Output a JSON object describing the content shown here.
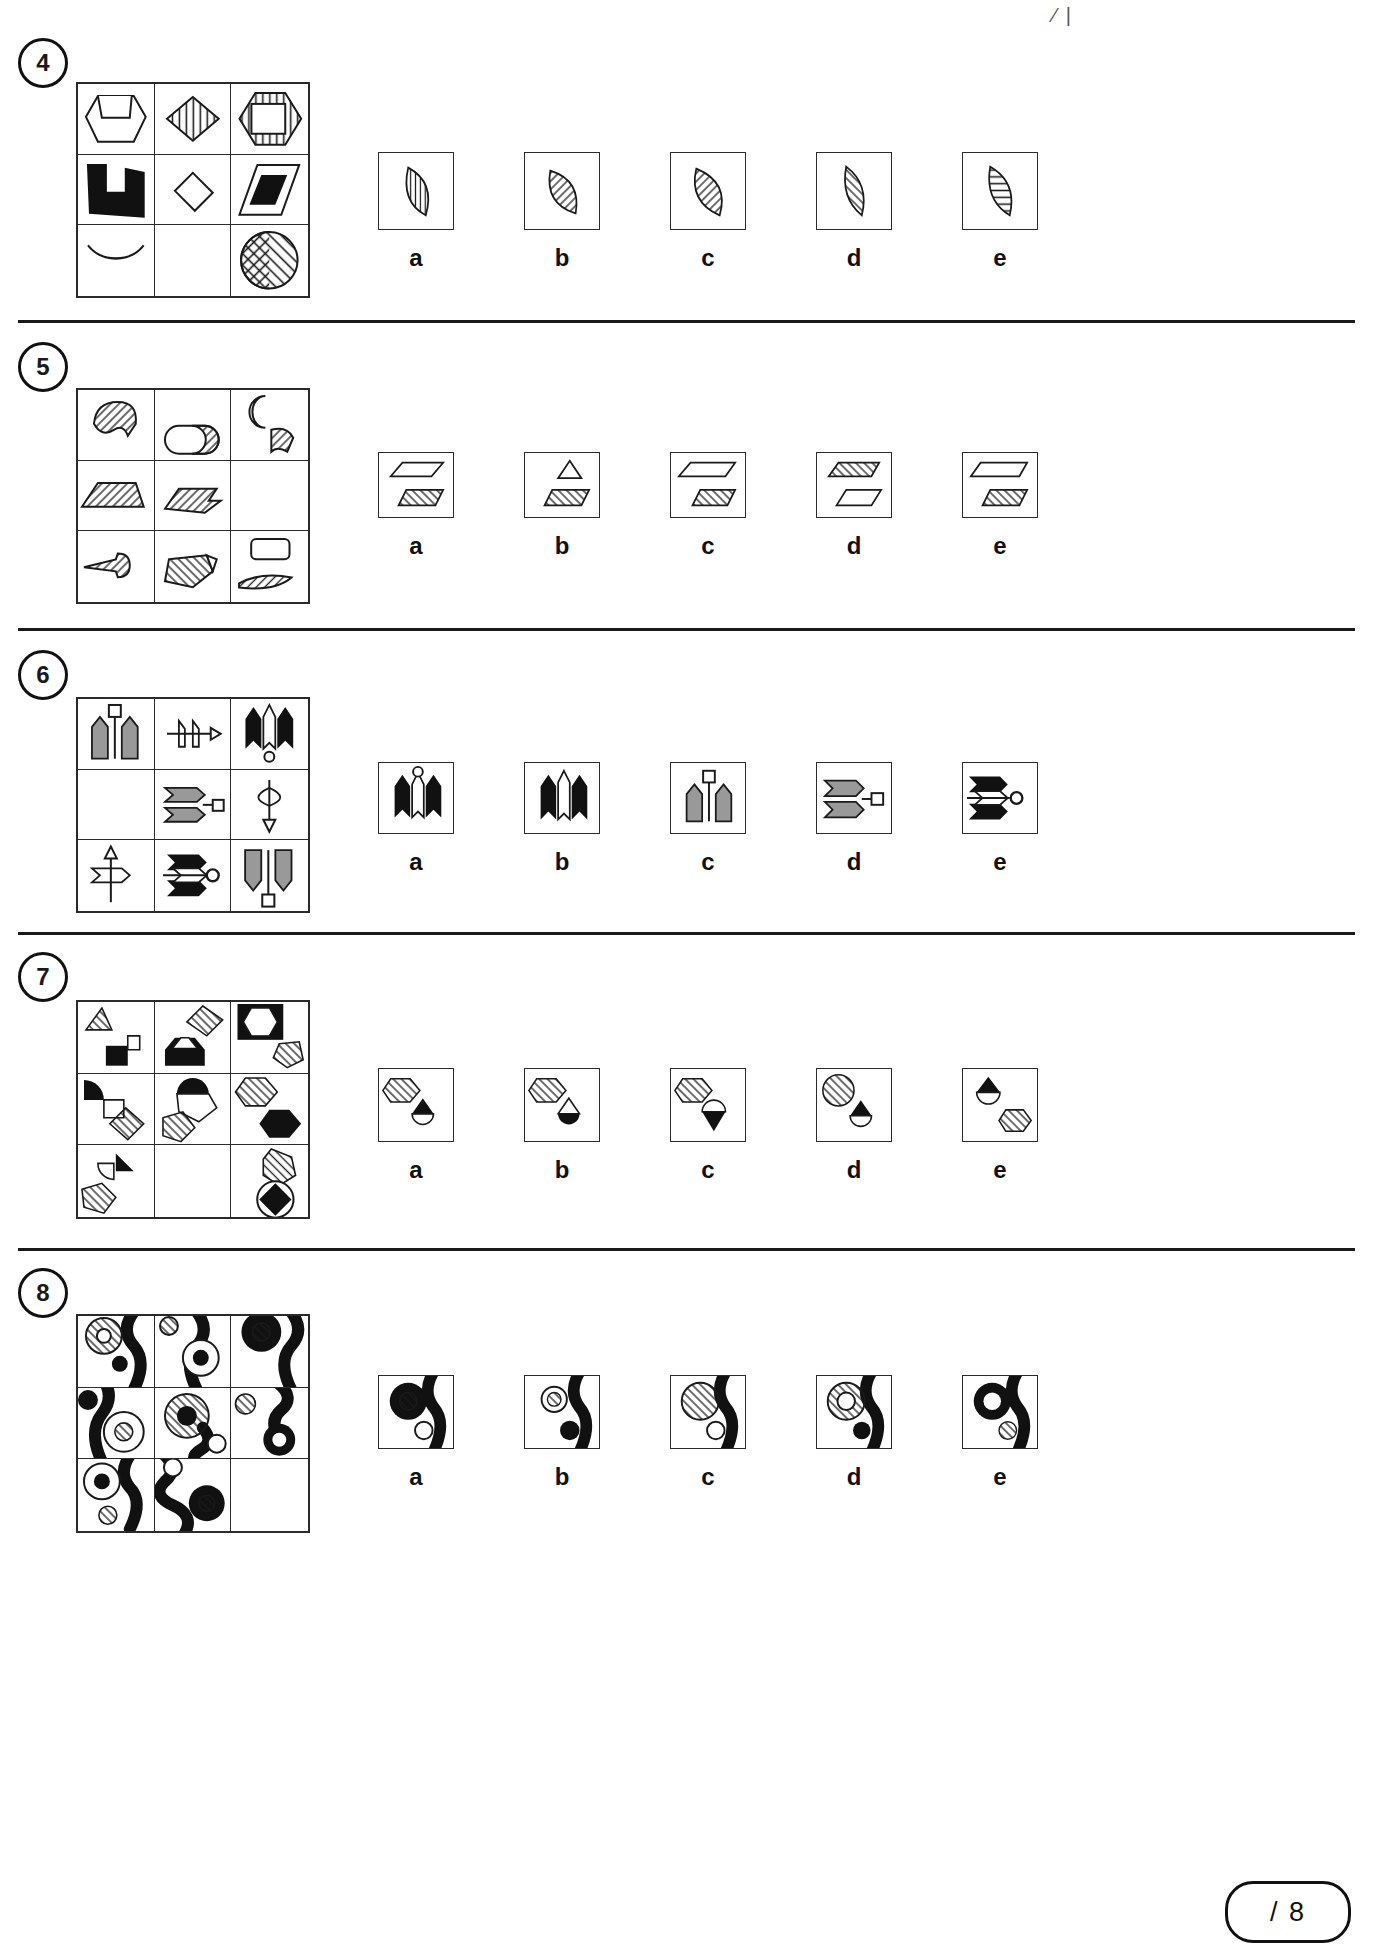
{
  "page": {
    "test_type": "non-verbal-reasoning-matrices",
    "corner_mark": "⁄ |",
    "score_label": "/ 8"
  },
  "option_letters": [
    "a",
    "b",
    "c",
    "d",
    "e"
  ],
  "questions": [
    {
      "number": "4",
      "matrix": {
        "rows": 3,
        "cols": 3,
        "cells": [
          "open-hexagon-with-notch",
          "diamond-vertical-hatch",
          "hexagon-vertical-hatch-with-white-square",
          "black-u-shape",
          "small-white-diamond",
          "parallelogram-with-black-inner-parallelogram",
          "crescent-diagonal-hatch",
          "blank",
          "circle-diagonal-hatch-split"
        ],
        "missing_cell_index": 7
      },
      "options": [
        "lens-vertical-hatch-left-tilt",
        "lens-diagonal-hatch-right-tilt",
        "lens-diagonal-hatch-wide",
        "lens-diagonal-hatch-thin-left",
        "lens-horizontal-hatch"
      ]
    },
    {
      "number": "5",
      "matrix": {
        "rows": 3,
        "cols": 3,
        "cells": [
          "hatched-blob-arrow",
          "oval-with-hatched-half",
          "crescent-and-hatched-ribbon",
          "hatched-trapezoid",
          "hatched-parallelogram-arrow",
          "blank",
          "hatched-pointed-sliver",
          "hatched-flag-shape",
          "small-white-rounded-rect-and-hatched-sliver"
        ],
        "missing_cell_index": 5
      },
      "options": [
        "parallelogram-over-hatched-parallelogram",
        "small-triangle-over-hatched-trapezoid",
        "parallelogram-over-hatched-parallelogram-right",
        "hatched-trapezoid-over-plain-parallelogram",
        "plain-parallelogram-over-hatched-parallelogram"
      ]
    },
    {
      "number": "6",
      "matrix": {
        "rows": 3,
        "cols": 3,
        "cells": [
          "two-grey-arrows-up-with-square-pin",
          "white-arrow-right-with-notch",
          "black-arrows-up-triple-with-circle",
          "blank",
          "two-grey-arrows-right-with-square-pin",
          "white-arrow-down-lens",
          "white-arrow-right-with-up-line",
          "black-arrows-right-with-circle-pin",
          "two-grey-arrows-down-with-square-pin"
        ],
        "missing_cell_index": 3
      },
      "options": [
        "black-arrows-up-with-circle-pin",
        "black-arrows-up-triple",
        "two-grey-arrows-up-with-square-pin",
        "two-grey-arrows-right-with-square-pin",
        "black-arrows-right-with-circle-pin"
      ]
    },
    {
      "number": "7",
      "matrix": {
        "rows": 3,
        "cols": 3,
        "cells": [
          "hatched-triangle-and-black-square-flag",
          "hatched-diamond-and-black-house",
          "black-square-white-hexagon-and-hatched-pentagon",
          "black-quarter-circle-and-hatched-diamond",
          "black-dome-on-hexagon-and-hatched-pentagon",
          "hatched-hexagon-and-black-hexagon",
          "black-triangle-quarter-circle-and-hatched-pentagon",
          "blank",
          "hatched-heptagon-and-black-diamond-in-circle"
        ],
        "missing_cell_index": 7
      },
      "options": [
        "hatched-hexagon-and-black-top-half-circle",
        "hatched-hexagon-and-black-bottom-circle",
        "hatched-hexagon-and-black-triangle-down-circle",
        "hatched-circle-and-black-triangle-dome",
        "black-triangle-dome-and-hatched-hexagon"
      ]
    },
    {
      "number": "8",
      "matrix": {
        "rows": 3,
        "cols": 3,
        "cells": [
          "large-hatched-ring-and-black-dot-wave",
          "small-hatched-circle-and-ring-with-black-core-wave",
          "black-ring-with-hatched-core-wave",
          "black-dot-and-ring-with-hatched-core-wave",
          "large-hatched-ring-with-black-core-wave",
          "small-hatched-circle-and-black-ring-wave",
          "ring-with-black-core-and-small-circle-wave",
          "black-ring-with-hatched-core-wave-bottom",
          "blank"
        ],
        "missing_cell_index": 8
      },
      "options": [
        "black-ring-hatched-core-and-small-white-circle",
        "small-hatched-circle-and-black-ring",
        "hatched-circle-and-white-ring-on-wave",
        "hatched-ring-and-black-dot-on-wave",
        "black-ring-white-core-and-hatched-circle"
      ]
    }
  ]
}
